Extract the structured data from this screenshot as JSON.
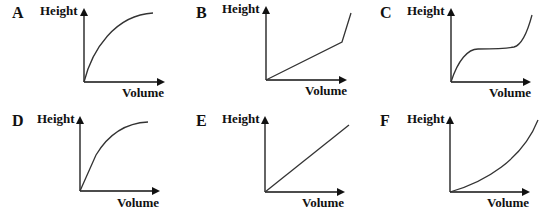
{
  "panels": [
    {
      "letter": "A",
      "ylabel": "Height",
      "xlabel": "Volume",
      "shape": "concave increasing curve (fast rise then levels off)"
    },
    {
      "letter": "B",
      "ylabel": "Height",
      "xlabel": "Volume",
      "shape": "straight gentle slope then sharp steep rise"
    },
    {
      "letter": "C",
      "ylabel": "Height",
      "xlabel": "Volume",
      "shape": "rise, flat plateau, then steep rise"
    },
    {
      "letter": "D",
      "ylabel": "Height",
      "xlabel": "Volume",
      "shape": "steep straight start then concave curve levelling off"
    },
    {
      "letter": "E",
      "ylabel": "Height",
      "xlabel": "Volume",
      "shape": "straight line through origin"
    },
    {
      "letter": "F",
      "ylabel": "Height",
      "xlabel": "Volume",
      "shape": "convex increasing curve (slow then fast)"
    }
  ],
  "colors": {
    "axis": "#111111",
    "curve": "#333333",
    "background": "#ffffff"
  }
}
